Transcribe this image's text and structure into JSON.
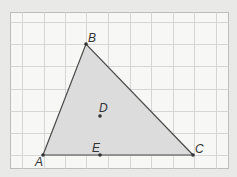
{
  "diagram": {
    "type": "triangle-on-grid",
    "colors": {
      "page_background": "#e9e9e8",
      "panel_background": "#f7f7f6",
      "panel_border": "#bdbdbd",
      "grid_line": "#d6d6d6",
      "triangle_fill": "#dcdcdc",
      "stroke": "#4a4a4a",
      "point": "#333333"
    },
    "grid": {
      "columns": 10,
      "rows": 7
    },
    "points": [
      {
        "name": "A",
        "label": "A",
        "x": 43,
        "y": 155
      },
      {
        "name": "B",
        "label": "B",
        "x": 86,
        "y": 44
      },
      {
        "name": "C",
        "label": "C",
        "x": 193,
        "y": 155
      },
      {
        "name": "D",
        "label": "D",
        "x": 100,
        "y": 116
      },
      {
        "name": "E",
        "label": "E",
        "x": 100,
        "y": 155
      }
    ],
    "triangle": [
      "A",
      "B",
      "C"
    ]
  }
}
